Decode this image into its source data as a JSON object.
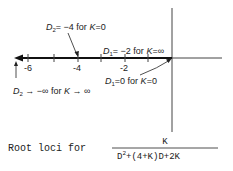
{
  "diagram": {
    "type": "root-locus",
    "axis": {
      "tick_labels": [
        "-6",
        "-4",
        "-2"
      ],
      "tick_values": [
        -6,
        -5,
        -4,
        -3,
        -2,
        -1
      ],
      "origin": 0
    },
    "annotations": {
      "d2_start": {
        "var": "D",
        "sub": "2",
        "text": "= −4 for ",
        "kvar": "K",
        "ktext": "=0"
      },
      "d1_end": {
        "var": "D",
        "sub": "1",
        "text": "= −2 for ",
        "kvar": "K",
        "ktext": "=∞"
      },
      "d1_start": {
        "var": "D",
        "sub": "1",
        "text": "=0 for ",
        "kvar": "K",
        "ktext": "=0"
      },
      "d2_end": {
        "var": "D",
        "sub": "2",
        "text": " → −∞ for ",
        "kvar": "K",
        "ktext": " → ∞"
      }
    },
    "caption": {
      "prefix": "Root loci for",
      "numerator": "K",
      "denominator_d": "D",
      "denominator_exp": "2",
      "denominator_rest": "+(4+K)D+2K"
    }
  }
}
